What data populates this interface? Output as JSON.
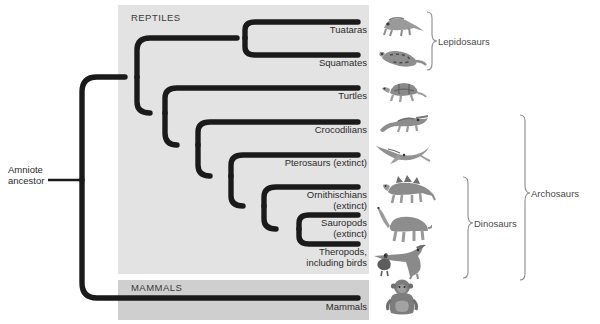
{
  "diagram": {
    "root_label_line1": "Amniote",
    "root_label_line2": "ancestor",
    "panels": [
      {
        "name": "reptiles",
        "label": "REPTILES",
        "color": "#e3e3e3"
      },
      {
        "name": "mammals",
        "label": "MAMMALS",
        "color": "#cfcfcf"
      }
    ],
    "tips": [
      {
        "id": "tuataras",
        "line1": "Tuataras",
        "line2": "",
        "y": 22,
        "branch_x": 245,
        "animal": "tuatara-icon"
      },
      {
        "id": "squamates",
        "line1": "Squamates",
        "line2": "",
        "y": 55,
        "branch_x": 245,
        "animal": "snake-icon"
      },
      {
        "id": "turtles",
        "line1": "Turtles",
        "line2": "",
        "y": 88,
        "branch_x": 172,
        "animal": "turtle-icon"
      },
      {
        "id": "crocodilians",
        "line1": "Crocodilians",
        "line2": "",
        "y": 122,
        "branch_x": 205,
        "animal": "crocodile-icon"
      },
      {
        "id": "pterosaurs",
        "line1": "Pterosaurs (extinct)",
        "line2": "",
        "y": 155,
        "branch_x": 238,
        "animal": "pterosaur-icon"
      },
      {
        "id": "ornithischians",
        "line1": "Ornithischians",
        "line2": "(extinct)",
        "y": 187,
        "branch_x": 272,
        "animal": "stegosaurus-icon"
      },
      {
        "id": "sauropods",
        "line1": "Sauropods",
        "line2": "(extinct)",
        "y": 215,
        "branch_x": 305,
        "animal": "sauropod-icon"
      },
      {
        "id": "theropods",
        "line1": "Theropods,",
        "line2": "including birds",
        "y": 243,
        "branch_x": 305,
        "animal": "theropod-bird-icon"
      },
      {
        "id": "mammals",
        "line1": "Mammals",
        "line2": "",
        "y": 298,
        "branch_x": 82,
        "animal": "primate-icon"
      }
    ],
    "groups": [
      {
        "id": "lepidosaurs",
        "label": "Lepidosaurs",
        "top": 12,
        "bottom": 70,
        "x": 432,
        "text_x": 447,
        "text_y": 36
      },
      {
        "id": "dinosaurs",
        "label": "Dinosaurs",
        "top": 177,
        "bottom": 278,
        "x": 468,
        "text_x": 483,
        "text_y": 222
      },
      {
        "id": "archosaurs",
        "label": "Archosaurs",
        "top": 115,
        "bottom": 280,
        "x": 525,
        "text_x": 540,
        "text_y": 192
      }
    ],
    "colors": {
      "branch": "#1a1a1a",
      "panel_reptiles": "#e3e3e3",
      "panel_mammals": "#cfcfcf",
      "bracket": "#8d8d8d",
      "text": "#2b2b2b"
    }
  }
}
